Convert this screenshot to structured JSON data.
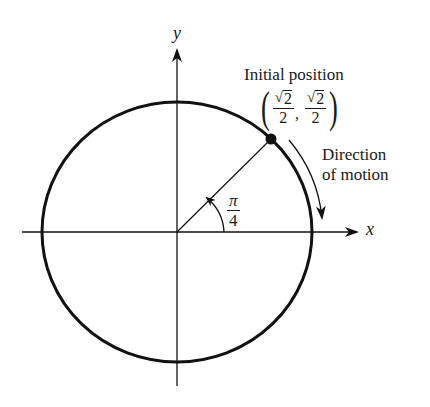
{
  "diagram": {
    "type": "unit-circle",
    "axes": {
      "x_label": "x",
      "y_label": "y"
    },
    "angle": {
      "numerator": "π",
      "denominator": "4"
    },
    "point": {
      "caption": "Initial position",
      "x": {
        "radical": "√",
        "radicand": "2",
        "denominator": "2"
      },
      "y": {
        "radical": "√",
        "radicand": "2",
        "denominator": "2"
      },
      "open_paren": "(",
      "close_paren": ")",
      "separator": ","
    },
    "motion": {
      "line1": "Direction",
      "line2": "of motion"
    },
    "colors": {
      "stroke": "#111111",
      "background": "#ffffff"
    }
  }
}
